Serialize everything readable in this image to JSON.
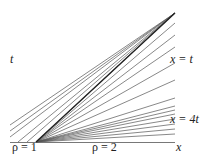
{
  "diagram": {
    "axis": {
      "x1": 10,
      "y1": 142.5,
      "x2": 175,
      "y2": 142.5,
      "color": "#555555"
    },
    "fan_origin": {
      "x": 36,
      "y": 142
    },
    "apex": {
      "x": 175,
      "y": 13
    },
    "fan_right_edge_x": 175,
    "fan_endpoints_y": [
      13,
      23,
      35,
      47,
      63,
      80,
      98,
      106,
      110,
      114,
      119,
      124,
      129,
      134
    ],
    "left_lines_start": [
      {
        "x": 10,
        "y": 125
      },
      {
        "x": 10,
        "y": 131
      },
      {
        "x": 10,
        "y": 137
      },
      {
        "x": 18,
        "y": 142
      },
      {
        "x": 27,
        "y": 142
      }
    ],
    "shock_line_color": "#222222",
    "line_color": "#555555"
  },
  "labels": {
    "t_axis": "t",
    "x_eq_t": "x = t",
    "x_eq_4t": "x = 4t",
    "rho_left": "ρ = 1",
    "rho_right": "ρ = 2",
    "x_axis": "x"
  }
}
